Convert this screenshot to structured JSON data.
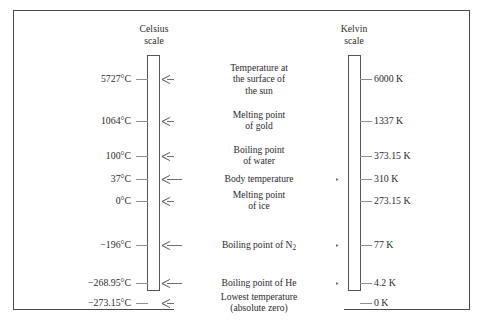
{
  "figure": {
    "celsius_header": "Celsius\nscale",
    "kelvin_header": "Kelvin\nscale",
    "rows": [
      {
        "celsius": "5727°C",
        "kelvin": "6000 K",
        "label": "Temperature at\nthe surface of\nthe sun",
        "lines": 3
      },
      {
        "celsius": "1064°C",
        "kelvin": "1337 K",
        "label": "Melting point\nof gold",
        "lines": 2
      },
      {
        "celsius": "100°C",
        "kelvin": "373.15 K",
        "label": "Boiling point\nof water",
        "lines": 2
      },
      {
        "celsius": "37°C",
        "kelvin": "310 K",
        "label": "Body temperature",
        "lines": 1
      },
      {
        "celsius": "0°C",
        "kelvin": "273.15 K",
        "label": "Melting point\nof ice",
        "lines": 2
      },
      {
        "celsius": "−196°C",
        "kelvin": "77 K",
        "label": "Boiling point of N",
        "lines": 1,
        "sub": "2"
      },
      {
        "celsius": "−268.95°C",
        "kelvin": "4.2 K",
        "label": "Boiling point of He",
        "lines": 1
      },
      {
        "celsius": "−273.15°C",
        "kelvin": "0 K",
        "label": "Lowest temperature\n(absolute zero)",
        "lines": 2
      }
    ]
  },
  "chart_data": {
    "type": "table",
    "categories": [
      "Temperature at the surface of the sun",
      "Melting point of gold",
      "Boiling point of water",
      "Body temperature",
      "Melting point of ice",
      "Boiling point of N2",
      "Boiling point of He",
      "Lowest temperature (absolute zero)"
    ],
    "series": [
      {
        "name": "Celsius scale",
        "unit": "°C",
        "values": [
          5727,
          1064,
          100,
          37,
          0,
          -196,
          -268.95,
          -273.15
        ]
      },
      {
        "name": "Kelvin scale",
        "unit": "K",
        "values": [
          6000,
          1337,
          373.15,
          310,
          273.15,
          77,
          4.2,
          0
        ]
      }
    ]
  }
}
